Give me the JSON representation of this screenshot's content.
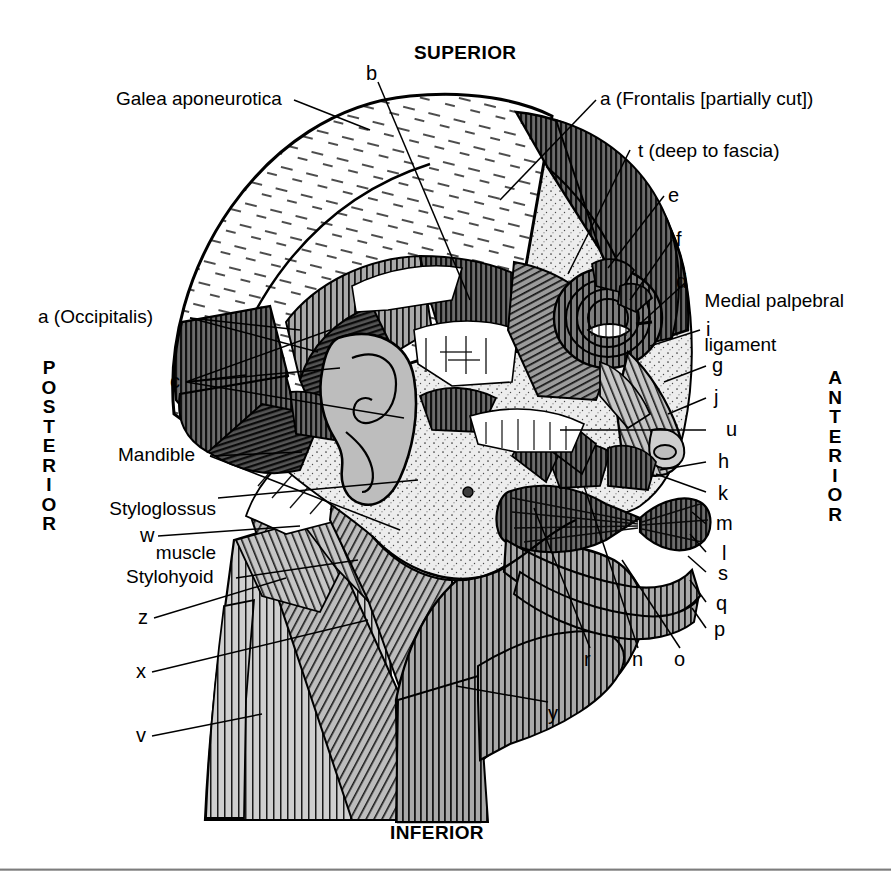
{
  "figure": {
    "kind": "anatomical-illustration",
    "orientation": {
      "superior": "SUPERIOR",
      "inferior": "INFERIOR",
      "anterior": "ANTERIOR",
      "posterior": "POSTERIOR"
    },
    "palette": {
      "ink": "#000000",
      "page": "#ffffff",
      "muscle_dark": "#3b3b3b",
      "muscle_mid": "#8a8a8a",
      "muscle_light": "#b9b9b9",
      "bone": "#e9e9e9",
      "cartilage": "#bdbdbd",
      "rule": "#6e6e6e"
    },
    "named_labels": [
      {
        "id": "galea",
        "text": "Galea aponeurotica",
        "side": "left"
      },
      {
        "id": "occipitalis",
        "text": "a (Occipitalis)",
        "side": "left"
      },
      {
        "id": "mandible",
        "text": "Mandible",
        "side": "left"
      },
      {
        "id": "styloglossus",
        "text": "Styloglossus\nmuscle",
        "side": "left"
      },
      {
        "id": "stylohyoid",
        "text": "Stylohyoid",
        "side": "left"
      },
      {
        "id": "frontalis",
        "text": "a (Frontalis [partially cut])",
        "side": "right"
      },
      {
        "id": "t_fascia",
        "text": "t (deep to fascia)",
        "side": "right"
      },
      {
        "id": "medial_palpebral",
        "text": "Medial palpebral\nligament",
        "side": "right"
      }
    ],
    "letter_labels": [
      {
        "id": "b",
        "text": "b",
        "side": "top"
      },
      {
        "id": "c",
        "text": "c",
        "side": "left"
      },
      {
        "id": "w",
        "text": "w",
        "side": "left"
      },
      {
        "id": "z",
        "text": "z",
        "side": "left"
      },
      {
        "id": "x",
        "text": "x",
        "side": "left"
      },
      {
        "id": "v",
        "text": "v",
        "side": "left"
      },
      {
        "id": "e",
        "text": "e",
        "side": "right"
      },
      {
        "id": "f",
        "text": "f",
        "side": "right"
      },
      {
        "id": "d",
        "text": "d",
        "side": "right"
      },
      {
        "id": "i",
        "text": "i",
        "side": "right"
      },
      {
        "id": "g",
        "text": "g",
        "side": "right"
      },
      {
        "id": "j",
        "text": "j",
        "side": "right"
      },
      {
        "id": "u",
        "text": "u",
        "side": "right"
      },
      {
        "id": "h",
        "text": "h",
        "side": "right"
      },
      {
        "id": "k",
        "text": "k",
        "side": "right"
      },
      {
        "id": "m",
        "text": "m",
        "side": "right"
      },
      {
        "id": "l",
        "text": "l",
        "side": "right"
      },
      {
        "id": "s",
        "text": "s",
        "side": "right"
      },
      {
        "id": "q",
        "text": "q",
        "side": "right"
      },
      {
        "id": "p",
        "text": "p",
        "side": "right"
      },
      {
        "id": "r",
        "text": "r",
        "side": "bottom"
      },
      {
        "id": "n",
        "text": "n",
        "side": "bottom"
      },
      {
        "id": "o",
        "text": "o",
        "side": "bottom"
      },
      {
        "id": "y",
        "text": "y",
        "side": "bottom"
      }
    ]
  }
}
